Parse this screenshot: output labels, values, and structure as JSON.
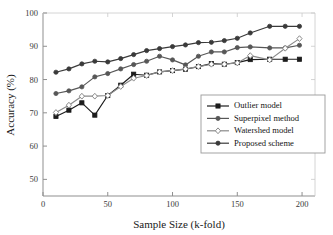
{
  "chart_data": {
    "type": "line",
    "title": "",
    "xlabel": "Sample Size (k-fold)",
    "ylabel": "Accuracy (%)",
    "xlim": [
      0,
      210
    ],
    "ylim": [
      45,
      100
    ],
    "xticks": [
      0,
      50,
      100,
      150,
      200
    ],
    "yticks": [
      50,
      60,
      70,
      80,
      90,
      100
    ],
    "xtick_labels": [
      "0",
      "50",
      "100",
      "150",
      "200"
    ],
    "ytick_labels": [
      "50",
      "60",
      "70",
      "80",
      "90",
      "100"
    ],
    "grid": false,
    "legend_position": "lower-right",
    "x": [
      10,
      20,
      30,
      40,
      50,
      60,
      70,
      80,
      90,
      100,
      110,
      120,
      130,
      140,
      150,
      160,
      175,
      187,
      198
    ],
    "series": [
      {
        "name": "Outlier model",
        "marker": "square",
        "color": "#1c1c1c",
        "values": [
          68.9,
          70.8,
          73.0,
          69.3,
          75.2,
          78.3,
          81.6,
          81.3,
          82.3,
          82.7,
          83.1,
          83.9,
          84.8,
          84.6,
          85.1,
          86.0,
          86.1,
          86.1,
          86.1
        ]
      },
      {
        "name": "Superpixel method",
        "marker": "circle",
        "color": "#575757",
        "values": [
          75.8,
          76.6,
          77.8,
          80.8,
          81.8,
          83.2,
          84.5,
          85.5,
          87.0,
          85.9,
          84.4,
          87.0,
          88.3,
          88.3,
          89.6,
          89.8,
          89.5,
          89.5,
          90.3
        ]
      },
      {
        "name": "Watershed model",
        "marker": "diamond",
        "color": "#8a8a8a",
        "values": [
          70.1,
          72.3,
          75.0,
          75.0,
          75.2,
          77.9,
          80.4,
          81.2,
          82.3,
          82.7,
          83.2,
          83.9,
          84.6,
          84.6,
          85.0,
          87.2,
          85.9,
          89.4,
          92.3
        ]
      },
      {
        "name": "Proposed scheme",
        "marker": "circle",
        "color": "#3a3a3a",
        "values": [
          82.2,
          83.2,
          84.7,
          85.5,
          85.3,
          86.3,
          87.5,
          88.7,
          89.3,
          89.9,
          90.4,
          91.1,
          91.2,
          91.7,
          92.4,
          94.0,
          96.0,
          96.0,
          96.0
        ]
      }
    ]
  },
  "legend": {
    "items": [
      {
        "label": "Outlier model"
      },
      {
        "label": "Superpixel method"
      },
      {
        "label": "Watershed model"
      },
      {
        "label": "Proposed scheme"
      }
    ]
  }
}
